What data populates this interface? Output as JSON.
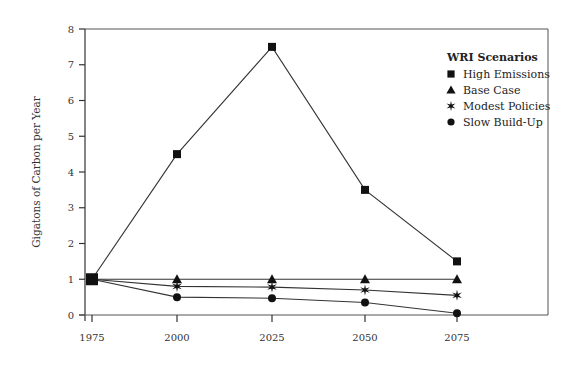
{
  "chart_data": {
    "type": "line",
    "title": "",
    "xlabel": "",
    "ylabel": "Gigatons of Carbon per Year",
    "x": [
      1975,
      2000,
      2025,
      2050,
      2075
    ],
    "x_tick_labels": [
      "1975",
      "2000",
      "2025",
      "2050",
      "2075"
    ],
    "y_tick_labels": [
      "0",
      "1",
      "2",
      "3",
      "4",
      "5",
      "6",
      "7",
      "8"
    ],
    "ylim": [
      0,
      8
    ],
    "xlim": [
      1975,
      2100
    ],
    "grid": false,
    "legend": {
      "title": "WRI Scenarios",
      "position": "upper right"
    },
    "series": [
      {
        "name": "High Emissions",
        "marker": "square",
        "values": [
          1.0,
          4.5,
          7.5,
          3.5,
          1.5
        ]
      },
      {
        "name": "Base Case",
        "marker": "triangle",
        "values": [
          1.0,
          1.0,
          1.0,
          1.0,
          1.0
        ]
      },
      {
        "name": "Modest Policies",
        "marker": "star",
        "values": [
          1.0,
          0.8,
          0.78,
          0.7,
          0.55
        ]
      },
      {
        "name": "Slow Build-Up",
        "marker": "circle",
        "values": [
          1.0,
          0.5,
          0.47,
          0.35,
          0.05
        ]
      }
    ]
  },
  "colors": {
    "line": "#333333",
    "marker": "#111111",
    "frame": "#555555"
  }
}
